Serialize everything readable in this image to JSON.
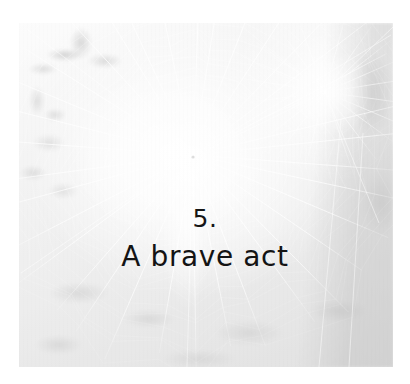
{
  "page": {
    "background_color": "#ffffff",
    "width": 410,
    "height": 384
  },
  "photo": {
    "subject": "spider-web-in-foliage",
    "alt_text": "Pale, overexposed black-and-white photograph of a large orb spider web strung between backlit leaves and branches",
    "tone": "high-key black and white",
    "dominant_colors": [
      "#ffffff",
      "#f0f0f0",
      "#dcdcdc",
      "#c9c9c9"
    ],
    "frame": {
      "left": 19,
      "top": 23,
      "width": 374,
      "height": 344
    },
    "webs": [
      {
        "name": "main-web",
        "hub_x": 174,
        "hub_y": 132,
        "radials": 34,
        "spiral_rings": 26
      },
      {
        "name": "secondary-web",
        "hub_x": 306,
        "hub_y": 69,
        "radials": 22,
        "spiral_rings": 14
      }
    ]
  },
  "title": {
    "number": "5.",
    "heading": "A brave act",
    "text_color": "#141414"
  }
}
